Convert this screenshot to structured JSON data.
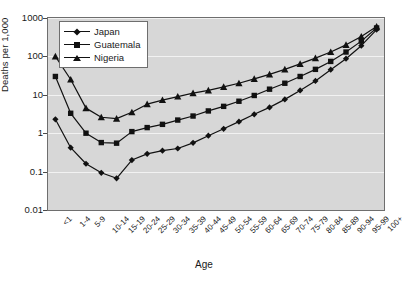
{
  "chart_data": {
    "type": "line",
    "title": "",
    "xlabel": "Age",
    "ylabel": "Deaths per 1,000",
    "yscale": "log",
    "ylim": [
      0.01,
      1000
    ],
    "y_ticks": [
      1000,
      100,
      10,
      1,
      0.1,
      0.01
    ],
    "y_tick_labels": [
      "1000",
      "100",
      "10",
      "1",
      "0.1",
      "0.01"
    ],
    "grid": true,
    "legend_position": "upper-left-inside",
    "categories": [
      "<1",
      "1-4",
      "5-9",
      "10-14",
      "15-19",
      "20-24",
      "25-29",
      "30-34",
      "35-39",
      "40-44",
      "45-49",
      "50-54",
      "55-59",
      "60-64",
      "65-69",
      "70-74",
      "75-79",
      "80-84",
      "85-89",
      "90-94",
      "95-99",
      "100+"
    ],
    "series": [
      {
        "name": "Japan",
        "marker": "diamond",
        "color": "#111111",
        "values": [
          2.3,
          0.42,
          0.16,
          0.093,
          0.067,
          0.2,
          0.29,
          0.35,
          0.4,
          0.56,
          0.86,
          1.3,
          2.0,
          3.1,
          4.7,
          7.6,
          13,
          23,
          45,
          87,
          190,
          500
        ]
      },
      {
        "name": "Guatemala",
        "marker": "square",
        "color": "#111111",
        "values": [
          30,
          3.3,
          1.0,
          0.57,
          0.55,
          1.1,
          1.4,
          1.7,
          2.2,
          2.8,
          3.8,
          5.0,
          6.8,
          9.6,
          14,
          20,
          30,
          46,
          74,
          130,
          250,
          550
        ]
      },
      {
        "name": "Nigeria",
        "marker": "triangle",
        "color": "#111111",
        "values": [
          100,
          25,
          4.5,
          2.6,
          2.4,
          3.5,
          5.7,
          7.3,
          9.0,
          11,
          13,
          16,
          20,
          26,
          34,
          46,
          64,
          90,
          130,
          200,
          330,
          600
        ]
      }
    ]
  },
  "legend": {
    "items": [
      {
        "label": "Japan",
        "marker": "diamond"
      },
      {
        "label": "Guatemala",
        "marker": "square"
      },
      {
        "label": "Nigeria",
        "marker": "triangle"
      }
    ]
  }
}
